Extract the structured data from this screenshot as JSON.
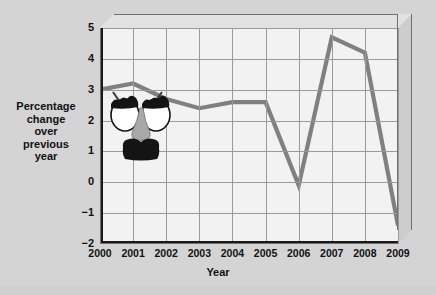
{
  "figure": {
    "background_color": "#d4d4d4",
    "panel_color": "#f2f2f2",
    "line_color": "#808080",
    "axis_color": "#1a1a1a",
    "grid_color": "#9a9a9a"
  },
  "annotation": {
    "name": "groucho-disguise",
    "description": "Groucho Marx novelty disguise: eyebrows, glasses, nose and moustache"
  },
  "chart_data": {
    "type": "line",
    "title": "Cost-of-laughing index",
    "xlabel": "Year",
    "ylabel": "Percentage change over previous year",
    "ylabel_lines": [
      "Percentage",
      "change",
      "over",
      "previous",
      "year"
    ],
    "categories": [
      "2000",
      "2001",
      "2002",
      "2003",
      "2004",
      "2005",
      "2006",
      "2007",
      "2008",
      "2009"
    ],
    "x": [
      2000,
      2001,
      2002,
      2003,
      2004,
      2005,
      2006,
      2007,
      2008,
      2009
    ],
    "values": [
      3.0,
      3.2,
      2.7,
      2.4,
      2.6,
      2.6,
      -0.1,
      4.7,
      4.2,
      -1.4
    ],
    "ylim": [
      -2,
      5
    ],
    "xlim": [
      2000,
      2009
    ],
    "yticks": [
      5,
      4,
      3,
      2,
      1,
      0,
      -1,
      -2
    ],
    "ytick_labels": [
      "5",
      "4",
      "3",
      "2",
      "1",
      "0",
      "−1",
      "−2"
    ],
    "grid": true,
    "legend": null,
    "legend_position": "none",
    "series": [
      {
        "name": "Cost-of-laughing index",
        "values": [
          3.0,
          3.2,
          2.7,
          2.4,
          2.6,
          2.6,
          -0.1,
          4.7,
          4.2,
          -1.4
        ]
      }
    ]
  }
}
